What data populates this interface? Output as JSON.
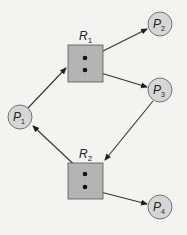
{
  "diagram": {
    "type": "resource-allocation-graph",
    "colors": {
      "background": "#f3f3f1",
      "process_fill": "#d6d6d6",
      "resource_fill": "#b4b4b4",
      "stroke": "#333333"
    },
    "processes": [
      {
        "id": "P1",
        "label": "P",
        "sub": "1",
        "cx": 20,
        "cy": 117
      },
      {
        "id": "P2",
        "label": "P",
        "sub": "2",
        "cx": 160,
        "cy": 24
      },
      {
        "id": "P3",
        "label": "P",
        "sub": "3",
        "cx": 160,
        "cy": 90
      },
      {
        "id": "P4",
        "label": "P",
        "sub": "4",
        "cx": 160,
        "cy": 207
      }
    ],
    "resources": [
      {
        "id": "R1",
        "label": "R",
        "sub": "1",
        "instances": 2
      },
      {
        "id": "R2",
        "label": "R",
        "sub": "2",
        "instances": 2
      }
    ],
    "edges": [
      {
        "from": "P1",
        "to": "R1",
        "kind": "request"
      },
      {
        "from": "R1",
        "to": "P2",
        "kind": "assignment"
      },
      {
        "from": "R1",
        "to": "P3",
        "kind": "assignment"
      },
      {
        "from": "P3",
        "to": "R2",
        "kind": "request"
      },
      {
        "from": "R2",
        "to": "P1",
        "kind": "assignment"
      },
      {
        "from": "R2",
        "to": "P4",
        "kind": "assignment"
      }
    ]
  }
}
